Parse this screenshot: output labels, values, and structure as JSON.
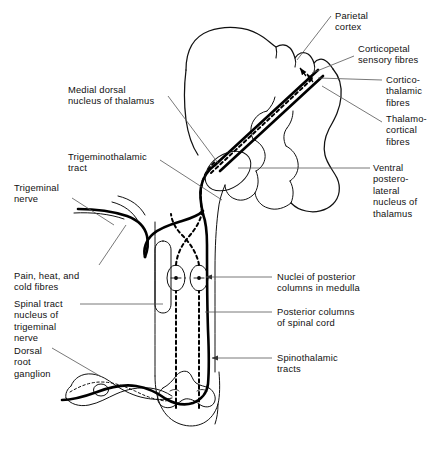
{
  "figure": {
    "type": "anatomical-line-diagram",
    "colors": {
      "background": "#ffffff",
      "outline": "#111111",
      "tract_solid": "#000000",
      "tract_dashed": "#000000",
      "leader_line": "#555555",
      "text": "#111111"
    }
  },
  "labels": {
    "left": [
      {
        "id": "medial-dorsal-nucleus",
        "text": "Medial dorsal\nnucleus of thalamus",
        "x": 68,
        "y": 84
      },
      {
        "id": "trigeminothalamic-tract",
        "text": "Trigeminothalamic\ntract",
        "x": 68,
        "y": 151
      },
      {
        "id": "trigeminal-nerve",
        "text": "Trigeminal\nnerve",
        "x": 14,
        "y": 182
      },
      {
        "id": "pain-heat-cold-fibres",
        "text": "Pain, heat, and\ncold fibres",
        "x": 14,
        "y": 270
      },
      {
        "id": "spinal-tract-nucleus",
        "text": "Spinal tract\nnucleus of\ntrigeminal\nnerve",
        "x": 14,
        "y": 298
      },
      {
        "id": "dorsal-root-ganglion",
        "text": "Dorsal\nroot\nganglion",
        "x": 14,
        "y": 345
      }
    ],
    "right": [
      {
        "id": "parietal-cortex",
        "text": "Parietal\ncortex",
        "x": 335,
        "y": 10
      },
      {
        "id": "corticopetal-sensory-fibres",
        "text": "Corticopetal\nsensory fibres",
        "x": 358,
        "y": 43
      },
      {
        "id": "cortico-thalamic-fibres",
        "text": "Cortico-\nthalamic\nfibres",
        "x": 386,
        "y": 74
      },
      {
        "id": "thalamo-cortical-fibres",
        "text": "Thalamo-\ncortical\nfibres",
        "x": 386,
        "y": 113
      },
      {
        "id": "ventral-posterolateral-nucleus",
        "text": "Ventral\npostero-\nlateral\nnucleus of\nthalamus",
        "x": 373,
        "y": 162
      },
      {
        "id": "nuclei-posterior-columns",
        "text": "Nuclei of posterior\ncolumns in medulla",
        "x": 277,
        "y": 271
      },
      {
        "id": "posterior-columns-spinal-cord",
        "text": "Posterior columns\nof spinal cord",
        "x": 277,
        "y": 306
      },
      {
        "id": "spinothalamic-tracts",
        "text": "Spinothalamic\ntracts",
        "x": 277,
        "y": 352
      }
    ]
  },
  "structures": [
    {
      "id": "cerebrum",
      "name": "Cerebrum with gyri and sulci"
    },
    {
      "id": "cerebellum",
      "name": "Cerebellum"
    },
    {
      "id": "thalamus-ellipse",
      "name": "Thalamus"
    },
    {
      "id": "brainstem",
      "name": "Brainstem and medulla"
    },
    {
      "id": "spinal-cord",
      "name": "Spinal cord"
    },
    {
      "id": "spinal-cord-grey-matter",
      "name": "Spinal cord grey matter butterfly"
    },
    {
      "id": "dorsal-root-ganglion-body",
      "name": "Dorsal root ganglion"
    },
    {
      "id": "nucleus-gracilis-cuneatus",
      "name": "Posterior column nuclei in medulla"
    },
    {
      "id": "spinal-trigeminal-nucleus",
      "name": "Spinal tract nucleus of trigeminal nerve"
    },
    {
      "id": "trigeminal-nerve-root",
      "name": "Trigeminal nerve root"
    },
    {
      "id": "decussation",
      "name": "Sensory decussation"
    }
  ]
}
